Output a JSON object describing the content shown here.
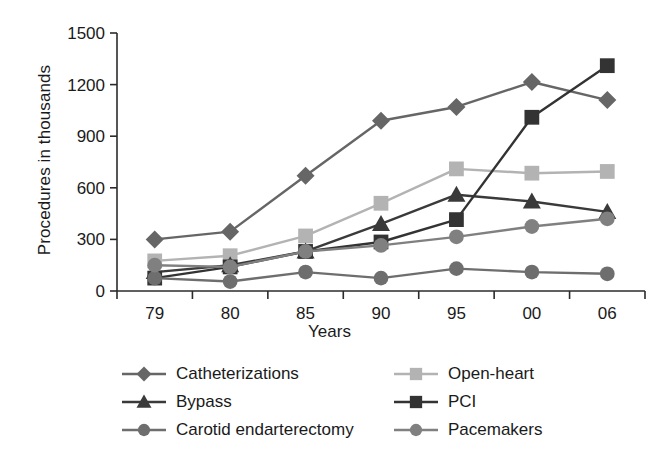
{
  "chart_data": {
    "type": "line",
    "title": "",
    "xlabel": "Years",
    "ylabel": "Procedures in thousands",
    "categories": [
      "79",
      "80",
      "85",
      "90",
      "95",
      "00",
      "06"
    ],
    "ylim": [
      0,
      1500
    ],
    "yticks": [
      0,
      300,
      600,
      900,
      1200,
      1500
    ],
    "grid": false,
    "legend_position": "bottom",
    "series": [
      {
        "name": "Catheterizations",
        "marker": "diamond",
        "color": "#666666",
        "values": [
          300,
          345,
          670,
          990,
          1070,
          1215,
          1110
        ]
      },
      {
        "name": "Open-heart",
        "marker": "square",
        "color": "#b3b3b3",
        "values": [
          175,
          205,
          320,
          510,
          710,
          685,
          695
        ]
      },
      {
        "name": "Bypass",
        "marker": "triangle",
        "color": "#3a3a3a",
        "values": [
          110,
          150,
          230,
          390,
          560,
          520,
          460
        ]
      },
      {
        "name": "PCI",
        "marker": "square",
        "color": "#333333",
        "values": [
          75,
          140,
          230,
          285,
          415,
          1010,
          1310
        ]
      },
      {
        "name": "Carotid endarterectomy",
        "marker": "circle",
        "color": "#6e6e6e",
        "values": [
          75,
          55,
          110,
          75,
          130,
          110,
          100
        ]
      },
      {
        "name": "Pacemakers",
        "marker": "circle",
        "color": "#808080",
        "values": [
          150,
          140,
          230,
          265,
          315,
          375,
          420
        ]
      }
    ]
  },
  "legend": {
    "columns": [
      [
        "Catheterizations",
        "Bypass",
        "Carotid endarterectomy"
      ],
      [
        "Open-heart",
        "PCI",
        "Pacemakers"
      ]
    ]
  }
}
